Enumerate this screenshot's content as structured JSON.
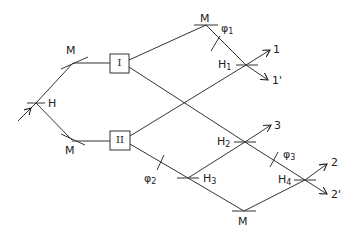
{
  "diagram": {
    "title": "",
    "input_label": "",
    "labels": {
      "H": "H",
      "M_upper": "M",
      "M_lower": "M",
      "M_top": "M",
      "M_bottom": "M",
      "box_I": "I",
      "box_II": "II",
      "phi1": "φ",
      "phi1_sub": "1",
      "phi2": "φ",
      "phi2_sub": "2",
      "phi3": "φ",
      "phi3_sub": "3",
      "H1": "H",
      "H1_sub": "1",
      "H2": "H",
      "H2_sub": "2",
      "H3": "H",
      "H3_sub": "3",
      "H4": "H",
      "H4_sub": "4",
      "out1": "1",
      "out1p": "1'",
      "out3": "3",
      "out2": "2",
      "out2p": "2'"
    },
    "nodes": [
      {
        "id": "H",
        "type": "beam-splitter",
        "x": 36,
        "y": 103
      },
      {
        "id": "M_upper",
        "type": "mirror",
        "x": 73,
        "y": 63
      },
      {
        "id": "M_lower",
        "type": "mirror",
        "x": 72,
        "y": 140
      },
      {
        "id": "I",
        "type": "source-box",
        "x": 119,
        "y": 63
      },
      {
        "id": "II",
        "type": "source-box",
        "x": 120,
        "y": 140
      },
      {
        "id": "M_top",
        "type": "mirror",
        "x": 206,
        "y": 25
      },
      {
        "id": "H1",
        "type": "beam-splitter",
        "x": 246,
        "y": 65
      },
      {
        "id": "H2",
        "type": "beam-splitter",
        "x": 245,
        "y": 142
      },
      {
        "id": "H3",
        "type": "beam-splitter",
        "x": 188,
        "y": 178
      },
      {
        "id": "H4",
        "type": "beam-splitter",
        "x": 305,
        "y": 180
      },
      {
        "id": "M_bottom",
        "type": "mirror",
        "x": 244,
        "y": 211
      }
    ],
    "outputs": [
      "1",
      "1'",
      "3",
      "2",
      "2'"
    ]
  }
}
